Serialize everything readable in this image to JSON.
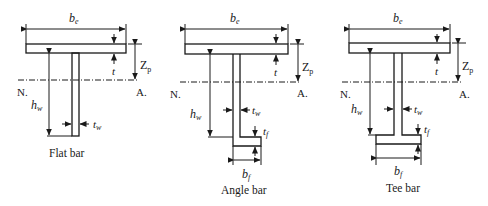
{
  "figure": {
    "panels": [
      {
        "id": "flat",
        "caption": "Flat bar",
        "labels": {
          "be": "b",
          "be_sub": "e",
          "t": "t",
          "zp": "Z",
          "zp_sub": "p",
          "n": "N.",
          "a": "A.",
          "hw": "h",
          "hw_sub": "w",
          "tw": "t",
          "tw_sub": "w"
        }
      },
      {
        "id": "angle",
        "caption": "Angle bar",
        "labels": {
          "be": "b",
          "be_sub": "e",
          "t": "t",
          "zp": "Z",
          "zp_sub": "p",
          "n": "N.",
          "a": "A.",
          "hw": "h",
          "hw_sub": "w",
          "tw": "t",
          "tw_sub": "w",
          "tf": "t",
          "tf_sub": "f",
          "bf": "b",
          "bf_sub": "f"
        }
      },
      {
        "id": "tee",
        "caption": "Tee bar",
        "labels": {
          "be": "b",
          "be_sub": "e",
          "t": "t",
          "zp": "Z",
          "zp_sub": "p",
          "n": "N.",
          "a": "A.",
          "hw": "h",
          "hw_sub": "w",
          "tw": "t",
          "tw_sub": "w",
          "tf": "t",
          "tf_sub": "f",
          "bf": "b",
          "bf_sub": "f"
        }
      }
    ],
    "colors": {
      "stroke": "#1a1a1a",
      "background": "#ffffff"
    }
  }
}
